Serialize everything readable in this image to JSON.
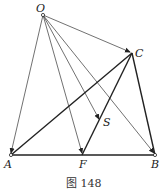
{
  "figure": {
    "caption": "图 148",
    "points": {
      "O": {
        "label": "O",
        "x": 43,
        "y": 15
      },
      "C": {
        "label": "C",
        "x": 132,
        "y": 53
      },
      "S": {
        "label": "S",
        "x": 100,
        "y": 121
      },
      "A": {
        "label": "A",
        "x": 11,
        "y": 155
      },
      "F": {
        "label": "F",
        "x": 82,
        "y": 155
      },
      "B": {
        "label": "B",
        "x": 155,
        "y": 155
      }
    },
    "thin_segments": [
      "O-A",
      "O-F",
      "O-S",
      "O-B",
      "O-C"
    ],
    "thick_segments": [
      "A-B",
      "A-C",
      "F-C",
      "C-B"
    ],
    "colors": {
      "line": "#222222",
      "background": "#ffffff"
    }
  }
}
